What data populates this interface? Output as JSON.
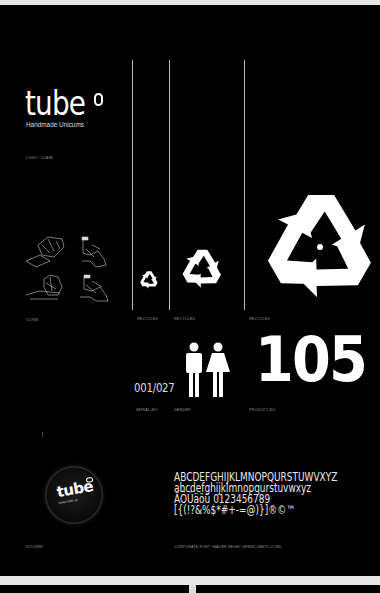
{
  "logo": {
    "word": "tube",
    "tagline": "Handmade Unicums",
    "caption": "Logo / Claim"
  },
  "icons": {
    "caption": "Icons"
  },
  "recycle": {
    "captions": [
      "Recycled",
      "Recycled",
      "Recycled"
    ]
  },
  "serial": {
    "value": "001/027",
    "caption": "Serial-No."
  },
  "gender": {
    "caption": "Gender"
  },
  "product": {
    "value": "105",
    "caption": "Product-No."
  },
  "sticker": {
    "word": "tube",
    "url": "www.tube.at",
    "caption": "Sticker"
  },
  "font": {
    "lines": [
      "ABCDEFGHIJKLMNOPQURSTUWVXYZ",
      "abcdefghijklmnopqurstuvwxyz",
      "ÄÖÜäöü 0123456789",
      "[{(!?&%$*#+-=@)}]®©™"
    ],
    "caption": "Corporate Font »Bauer Neue« (www.lineto.com)"
  },
  "colors": {
    "background": "#000000",
    "foreground": "#ffffff",
    "paper": "#e6e6e6"
  }
}
